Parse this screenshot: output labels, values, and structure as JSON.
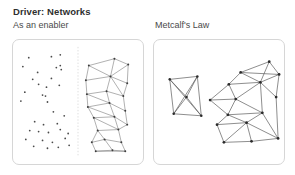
{
  "slide": {
    "title": "Driver: Networks",
    "left_caption": "As an enabler",
    "right_caption": "Metcalf's Law"
  },
  "colors": {
    "background": "#ffffff",
    "title_text": "#2f2f2f",
    "caption_text": "#4a4a4a",
    "panel_border": "#d6d6d6",
    "divider": "#cfcfcf",
    "edge_left": "#6e6e6e",
    "edge_right": "#5a5a5a",
    "node_left": "#4a4a4a",
    "node_right": "#2b2b2b"
  },
  "panels": {
    "left": {
      "name": "As an enabler",
      "divider_x": 66,
      "scatter": {
        "label": "unconnected-nodes",
        "radius": 0.9,
        "points": [
          [
            16,
            18
          ],
          [
            39,
            17
          ],
          [
            48,
            15
          ],
          [
            10,
            27
          ],
          [
            44,
            28
          ],
          [
            48,
            26
          ],
          [
            49,
            30
          ],
          [
            25,
            33
          ],
          [
            20,
            40
          ],
          [
            39,
            39
          ],
          [
            26,
            45
          ],
          [
            47,
            46
          ],
          [
            34,
            48
          ],
          [
            12,
            53
          ],
          [
            33,
            57
          ],
          [
            30,
            56
          ],
          [
            8,
            62
          ],
          [
            35,
            63
          ],
          [
            41,
            73
          ],
          [
            52,
            77
          ],
          [
            22,
            83
          ],
          [
            31,
            86
          ],
          [
            45,
            85
          ],
          [
            17,
            92
          ],
          [
            26,
            93
          ],
          [
            36,
            94
          ],
          [
            48,
            91
          ],
          [
            56,
            95
          ],
          [
            13,
            101
          ],
          [
            30,
            102
          ],
          [
            40,
            104
          ],
          [
            53,
            100
          ],
          [
            21,
            108
          ],
          [
            35,
            110
          ],
          [
            46,
            109
          ],
          [
            57,
            107
          ]
        ]
      },
      "network": {
        "label": "connected-network",
        "radius": 1.0,
        "nodes": [
          [
            77,
            26
          ],
          [
            103,
            19
          ],
          [
            117,
            25
          ],
          [
            74,
            41
          ],
          [
            99,
            37
          ],
          [
            116,
            44
          ],
          [
            75,
            55
          ],
          [
            95,
            52
          ],
          [
            112,
            57
          ],
          [
            76,
            68
          ],
          [
            98,
            64
          ],
          [
            114,
            72
          ],
          [
            82,
            79
          ],
          [
            103,
            78
          ],
          [
            116,
            86
          ],
          [
            86,
            92
          ],
          [
            107,
            91
          ],
          [
            80,
            104
          ],
          [
            93,
            101
          ],
          [
            110,
            104
          ],
          [
            84,
            113
          ],
          [
            101,
            112
          ],
          [
            114,
            113
          ]
        ],
        "edges": [
          [
            0,
            1
          ],
          [
            1,
            2
          ],
          [
            0,
            3
          ],
          [
            2,
            5
          ],
          [
            0,
            4
          ],
          [
            1,
            4
          ],
          [
            2,
            4
          ],
          [
            3,
            4
          ],
          [
            4,
            5
          ],
          [
            3,
            6
          ],
          [
            5,
            8
          ],
          [
            4,
            7
          ],
          [
            6,
            7
          ],
          [
            7,
            8
          ],
          [
            4,
            8
          ],
          [
            6,
            9
          ],
          [
            8,
            11
          ],
          [
            7,
            10
          ],
          [
            9,
            10
          ],
          [
            10,
            11
          ],
          [
            6,
            10
          ],
          [
            9,
            12
          ],
          [
            11,
            14
          ],
          [
            10,
            13
          ],
          [
            12,
            13
          ],
          [
            13,
            14
          ],
          [
            9,
            13
          ],
          [
            12,
            15
          ],
          [
            14,
            16
          ],
          [
            13,
            16
          ],
          [
            15,
            16
          ],
          [
            12,
            16
          ],
          [
            15,
            17
          ],
          [
            16,
            19
          ],
          [
            17,
            18
          ],
          [
            18,
            19
          ],
          [
            15,
            18
          ],
          [
            17,
            20
          ],
          [
            19,
            22
          ],
          [
            20,
            21
          ],
          [
            21,
            22
          ],
          [
            18,
            21
          ],
          [
            20,
            22
          ]
        ]
      }
    },
    "right": {
      "name": "Metcalf's Law",
      "small_network": {
        "label": "small-cluster",
        "radius": 1.3,
        "nodes": [
          [
            16,
            40
          ],
          [
            44,
            37
          ],
          [
            48,
            77
          ],
          [
            20,
            75
          ],
          [
            33,
            58
          ]
        ],
        "edges": [
          [
            0,
            1
          ],
          [
            1,
            2
          ],
          [
            2,
            3
          ],
          [
            3,
            0
          ],
          [
            0,
            4
          ],
          [
            1,
            4
          ],
          [
            2,
            4
          ],
          [
            3,
            4
          ],
          [
            0,
            2
          ],
          [
            1,
            3
          ]
        ]
      },
      "large_network": {
        "label": "large-cluster",
        "radius": 1.4,
        "nodes": [
          [
            88,
            33
          ],
          [
            117,
            22
          ],
          [
            127,
            35
          ],
          [
            76,
            45
          ],
          [
            108,
            43
          ],
          [
            57,
            61
          ],
          [
            83,
            60
          ],
          [
            124,
            58
          ],
          [
            75,
            76
          ],
          [
            110,
            74
          ],
          [
            64,
            86
          ],
          [
            94,
            84
          ],
          [
            126,
            100
          ],
          [
            71,
            104
          ],
          [
            99,
            103
          ]
        ],
        "edges": [
          [
            0,
            1
          ],
          [
            1,
            2
          ],
          [
            0,
            2
          ],
          [
            0,
            3
          ],
          [
            0,
            4
          ],
          [
            1,
            4
          ],
          [
            2,
            4
          ],
          [
            3,
            4
          ],
          [
            3,
            5
          ],
          [
            3,
            6
          ],
          [
            4,
            6
          ],
          [
            4,
            7
          ],
          [
            2,
            7
          ],
          [
            5,
            6
          ],
          [
            5,
            8
          ],
          [
            6,
            8
          ],
          [
            6,
            9
          ],
          [
            4,
            9
          ],
          [
            7,
            12
          ],
          [
            8,
            9
          ],
          [
            8,
            10
          ],
          [
            8,
            11
          ],
          [
            9,
            11
          ],
          [
            9,
            12
          ],
          [
            10,
            11
          ],
          [
            10,
            13
          ],
          [
            11,
            13
          ],
          [
            11,
            14
          ],
          [
            12,
            14
          ],
          [
            13,
            14
          ],
          [
            11,
            12
          ]
        ]
      }
    }
  }
}
